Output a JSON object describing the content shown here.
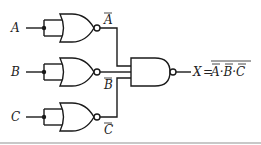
{
  "diagram": {
    "type": "logic-circuit",
    "inputs": [
      {
        "label": "A",
        "gate": "NOR (inputs tied, inverter)",
        "output_label": "A",
        "output_overbar": true
      },
      {
        "label": "B",
        "gate": "NOR (inputs tied, inverter)",
        "output_label": "B",
        "output_overbar": true
      },
      {
        "label": "C",
        "gate": "NOR (inputs tied, inverter)",
        "output_label": "C",
        "output_overbar": true
      }
    ],
    "final_gate": "NAND (3-input)",
    "output": {
      "lhs": "X",
      "equals": "=",
      "expression": "A·B·C",
      "terms": [
        "A",
        "B",
        "C"
      ],
      "separator": "·",
      "note": "each term individually overbarred, whole expression overbarred"
    },
    "colors": {
      "line": "#1a1a1a",
      "background": "#ffffff",
      "rule": "#c8c8c8"
    }
  }
}
